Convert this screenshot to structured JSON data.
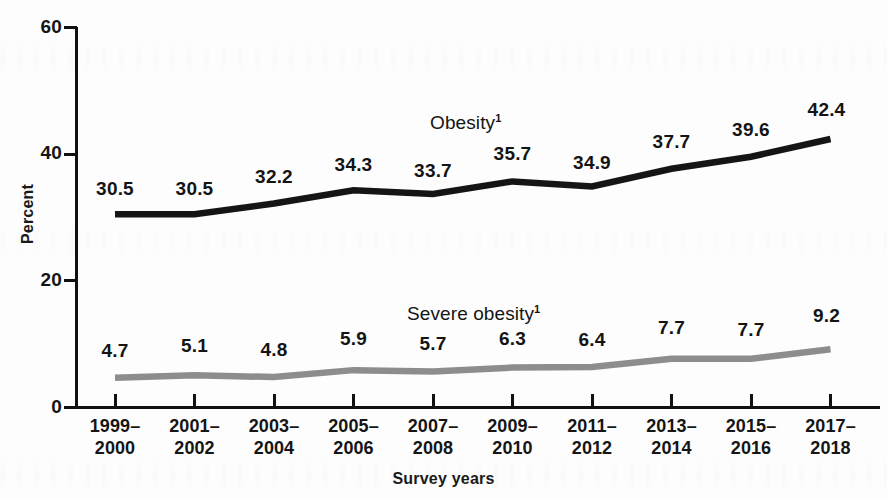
{
  "chart_data": {
    "type": "line",
    "title": "",
    "xlabel": "Survey years",
    "ylabel": "Percent",
    "ylim": [
      0,
      60
    ],
    "yticks": [
      0,
      20,
      40,
      60
    ],
    "grid": false,
    "legend_position": "inline-labels",
    "categories": [
      "1999–2000",
      "2001–2002",
      "2003–2004",
      "2005–2006",
      "2007–2008",
      "2009–2010",
      "2011–2012",
      "2013–2014",
      "2015–2016",
      "2017–2018"
    ],
    "category_lines": [
      [
        "1999–",
        "2000"
      ],
      [
        "2001–",
        "2002"
      ],
      [
        "2003–",
        "2004"
      ],
      [
        "2005–",
        "2006"
      ],
      [
        "2007–",
        "2008"
      ],
      [
        "2009–",
        "2010"
      ],
      [
        "2011–",
        "2012"
      ],
      [
        "2013–",
        "2014"
      ],
      [
        "2015–",
        "2016"
      ],
      [
        "2017–",
        "2018"
      ]
    ],
    "series": [
      {
        "name": "Obesity",
        "footnote_marker": "1",
        "color": "#151515",
        "values": [
          30.5,
          30.5,
          32.2,
          34.3,
          33.7,
          35.7,
          34.9,
          37.7,
          39.6,
          42.4
        ],
        "labels": [
          "30.5",
          "30.5",
          "32.2",
          "34.3",
          "33.7",
          "35.7",
          "34.9",
          "37.7",
          "39.6",
          "42.4"
        ]
      },
      {
        "name": "Severe obesity",
        "footnote_marker": "1",
        "color": "#8d8d8d",
        "values": [
          4.7,
          5.1,
          4.8,
          5.9,
          5.7,
          6.3,
          6.4,
          7.7,
          7.7,
          9.2
        ],
        "labels": [
          "4.7",
          "5.1",
          "4.8",
          "5.9",
          "5.7",
          "6.3",
          "6.4",
          "7.7",
          "7.7",
          "9.2"
        ]
      }
    ]
  },
  "axis": {
    "y_tick_labels": [
      "0",
      "20",
      "40",
      "60"
    ],
    "y_title": "Percent",
    "x_title": "Survey years"
  },
  "annotations": {
    "obesity_label": "Obesity",
    "obesity_sup": "1",
    "severe_obesity_label": "Severe obesity",
    "severe_obesity_sup": "1"
  }
}
